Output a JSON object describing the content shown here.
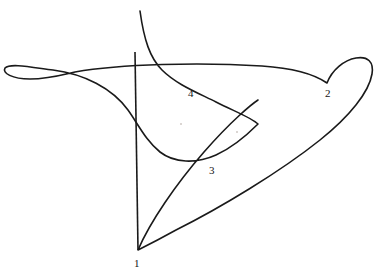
{
  "figure": {
    "title": "",
    "type": "topological-curve-diagram",
    "width": 381,
    "height": 279,
    "background_color": "#ffffff",
    "stroke_color": "#1a1a1a",
    "stroke_width": 1.6
  },
  "labels": [
    {
      "id": "label-1",
      "text": "1",
      "x": 134,
      "y": 258,
      "describes": "bottom-cusp"
    },
    {
      "id": "label-2",
      "text": "2",
      "x": 325,
      "y": 88,
      "describes": "right-cusp"
    },
    {
      "id": "label-3",
      "text": "3",
      "x": 209,
      "y": 165,
      "describes": "lower-inner-cusp"
    },
    {
      "id": "label-4",
      "text": "4",
      "x": 188,
      "y": 88,
      "describes": "upper-inner-region"
    }
  ],
  "geometry": {
    "main_curve_d": "M 140 11 C 144 40 150 58 162 70 C 176 84 196 92 216 102 C 236 112 252 118 258 124 C 250 132 236 146 216 155 C 196 164 174 163 160 152 C 146 141 138 124 128 110 C 112 88 84 74 53 70 C 30 67 10 63 5 68 C 2 73 12 79 30 79 C 48 79 62 75 75 72 C 120 64 200 62 262 66 C 292 68 314 74 327 83 C 332 70 344 60 356 58 C 368 56 374 62 372 74 C 369 92 350 116 320 140 C 280 172 220 208 176 230 C 158 240 144 247 138 250 C 150 222 176 184 204 152 C 232 120 252 104 258 100",
    "axis_line": {
      "x1": 135,
      "y1": 52,
      "x2": 138,
      "y2": 250
    },
    "cusps": [
      {
        "name": "cusp-1",
        "x": 138,
        "y": 250
      },
      {
        "name": "cusp-2",
        "x": 327,
        "y": 83
      },
      {
        "name": "cusp-3",
        "x": 258,
        "y": 124
      }
    ],
    "crossings": [
      {
        "name": "crossing-left-loop",
        "x": 53,
        "y": 70
      },
      {
        "name": "crossing-axis-top",
        "x": 136,
        "y": 68
      },
      {
        "name": "crossing-axis-mid",
        "x": 137,
        "y": 117
      }
    ],
    "specks": [
      {
        "x": 180,
        "y": 123
      },
      {
        "x": 236,
        "y": 131
      }
    ]
  }
}
